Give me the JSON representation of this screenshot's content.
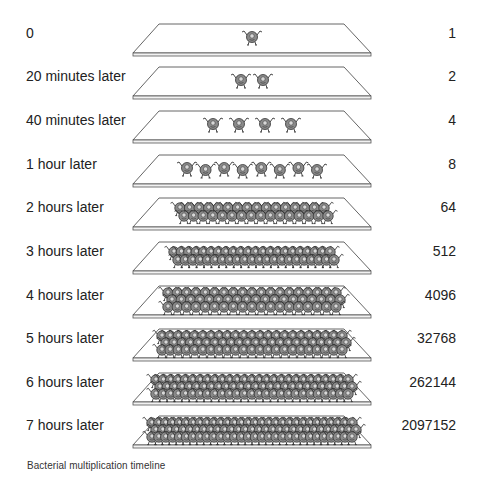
{
  "caption": "Bacterial multiplication timeline",
  "rows": [
    {
      "time": "0",
      "count": "1",
      "bacteria": 1
    },
    {
      "time": "20 minutes later",
      "count": "2",
      "bacteria": 2
    },
    {
      "time": "40 minutes later",
      "count": "4",
      "bacteria": 4
    },
    {
      "time": "1 hour later",
      "count": "8",
      "bacteria": 8
    },
    {
      "time": "2 hours later",
      "count": "64",
      "bacteria": 64
    },
    {
      "time": "3 hours later",
      "count": "512",
      "bacteria": 512
    },
    {
      "time": "4 hours later",
      "count": "4096",
      "bacteria": 4096
    },
    {
      "time": "5 hours later",
      "count": "32768",
      "bacteria": 32768
    },
    {
      "time": "6 hours later",
      "count": "262144",
      "bacteria": 262144
    },
    {
      "time": "7 hours later",
      "count": "2097152",
      "bacteria": 2097152
    }
  ],
  "colors": {
    "plate_stroke": "#555555",
    "bacteria_body": "#8a8a8a",
    "bacteria_outline": "#333333",
    "text": "#222222"
  }
}
